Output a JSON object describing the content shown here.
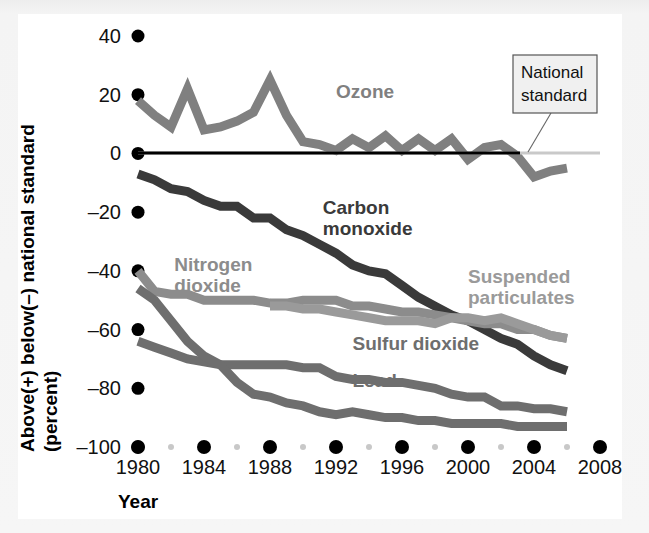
{
  "figure": {
    "background_color": "#f4f4f4",
    "plate_color": "#ffffff",
    "y_axis_title_line1": "Above(+) below(–) national standard",
    "y_axis_title_line2": "(percent)",
    "x_axis_title": "Year"
  },
  "callout": {
    "line1": "National",
    "line2": "standard",
    "box_fill": "#f0f0f0",
    "box_stroke": "#555555"
  },
  "chart_data": {
    "type": "line",
    "title": "",
    "xlabel": "Year",
    "ylabel": "Above(+) below(–) national standard (percent)",
    "xlim": [
      1980,
      2008
    ],
    "ylim": [
      -100,
      40
    ],
    "xticks": [
      1980,
      1984,
      1988,
      1992,
      1996,
      2000,
      2004,
      2008
    ],
    "xticklabels": [
      "1980",
      "1984",
      "1988",
      "1992",
      "1996",
      "2000",
      "2004",
      "2008"
    ],
    "minor_xticks": [
      1982,
      1986,
      1990,
      1994,
      1998,
      2002,
      2006
    ],
    "yticks": [
      40,
      20,
      0,
      -20,
      -40,
      -60,
      -80,
      -100
    ],
    "yticklabels": [
      "40",
      "20",
      "0",
      "–20",
      "–40",
      "–60",
      "–80",
      "–100"
    ],
    "grid": false,
    "legend": "inline-labels",
    "reference_line": {
      "value": 0,
      "label": "National standard",
      "color": "#000000"
    },
    "series": [
      {
        "name": "Ozone",
        "color": "#808080",
        "label_x": 1992.0,
        "label_y": 19.0,
        "x": [
          1980,
          1981,
          1982,
          1983,
          1984,
          1985,
          1986,
          1987,
          1988,
          1989,
          1990,
          1991,
          1992,
          1993,
          1994,
          1995,
          1996,
          1997,
          1998,
          1999,
          2000,
          2001,
          2002,
          2003,
          2004,
          2005,
          2006
        ],
        "values": [
          18,
          13,
          9,
          22,
          8,
          9,
          11,
          14,
          25,
          13,
          4,
          3,
          1,
          5,
          2,
          6,
          1,
          5,
          1,
          5,
          -2,
          2,
          3,
          -1,
          -8,
          -6,
          -5
        ]
      },
      {
        "name": "Carbon monoxide",
        "color": "#3a3a3a",
        "label_x": 1991.2,
        "label_y": -20.5,
        "x": [
          1980,
          1981,
          1982,
          1983,
          1984,
          1985,
          1986,
          1987,
          1988,
          1989,
          1990,
          1991,
          1992,
          1993,
          1994,
          1995,
          1996,
          1997,
          1998,
          1999,
          2000,
          2001,
          2002,
          2003,
          2004,
          2005,
          2006
        ],
        "values": [
          -7,
          -9,
          -12,
          -13,
          -16,
          -18,
          -18,
          -22,
          -22,
          -26,
          -28,
          -31,
          -34,
          -38,
          -40,
          -41,
          -45,
          -49,
          -52,
          -55,
          -57,
          -60,
          -63,
          -65,
          -69,
          -72,
          -74
        ]
      },
      {
        "name": "Nitrogen dioxide",
        "color": "#8c8c8c",
        "label_x": 1982.2,
        "label_y": -40.0,
        "x": [
          1980,
          1981,
          1982,
          1983,
          1984,
          1985,
          1986,
          1987,
          1988,
          1989,
          1990,
          1991,
          1992,
          1993,
          1994,
          1995,
          1996,
          1997,
          1998,
          1999,
          2000,
          2001,
          2002,
          2003,
          2004,
          2005,
          2006
        ],
        "values": [
          -40,
          -47,
          -48,
          -48,
          -50,
          -50,
          -50,
          -50,
          -51,
          -51,
          -50,
          -50,
          -50,
          -52,
          -52,
          -53,
          -54,
          -54,
          -55,
          -56,
          -57,
          -58,
          -58,
          -60,
          -60,
          -62,
          -63
        ]
      },
      {
        "name": "Suspended particulates",
        "color": "#9a9a9a",
        "label_x": 2000.0,
        "label_y": -44.0,
        "x": [
          1988,
          1989,
          1990,
          1991,
          1992,
          1993,
          1994,
          1995,
          1996,
          1997,
          1998,
          1999,
          2000,
          2001,
          2002,
          2003,
          2004,
          2005,
          2006
        ],
        "values": [
          -52,
          -52,
          -53,
          -53,
          -54,
          -55,
          -56,
          -57,
          -57,
          -57,
          -58,
          -56,
          -56,
          -57,
          -56,
          -58,
          -60,
          -62,
          -63
        ]
      },
      {
        "name": "Sulfur dioxide",
        "color": "#6e6e6e",
        "label_x": 1993.0,
        "label_y": -67.0,
        "x": [
          1980,
          1981,
          1982,
          1983,
          1984,
          1985,
          1986,
          1987,
          1988,
          1989,
          1990,
          1991,
          1992,
          1993,
          1994,
          1995,
          1996,
          1997,
          1998,
          1999,
          2000,
          2001,
          2002,
          2003,
          2004,
          2005,
          2006
        ],
        "values": [
          -64,
          -66,
          -68,
          -70,
          -71,
          -72,
          -72,
          -72,
          -72,
          -72,
          -73,
          -73,
          -76,
          -77,
          -77,
          -78,
          -78,
          -79,
          -80,
          -82,
          -83,
          -83,
          -86,
          -86,
          -87,
          -87,
          -88
        ]
      },
      {
        "name": "Lead",
        "color": "#6e6e6e",
        "label_x": 1993.0,
        "label_y": -79.5,
        "x": [
          1980,
          1981,
          1982,
          1983,
          1984,
          1985,
          1986,
          1987,
          1988,
          1989,
          1990,
          1991,
          1992,
          1993,
          1994,
          1995,
          1996,
          1997,
          1998,
          1999,
          2000,
          2001,
          2002,
          2003,
          2004,
          2005,
          2006
        ],
        "values": [
          -46,
          -50,
          -57,
          -64,
          -69,
          -72,
          -78,
          -82,
          -83,
          -85,
          -86,
          -88,
          -89,
          -88,
          -89,
          -90,
          -90,
          -91,
          -91,
          -92,
          -92,
          -92,
          -92,
          -93,
          -93,
          -93,
          -93
        ]
      }
    ]
  }
}
